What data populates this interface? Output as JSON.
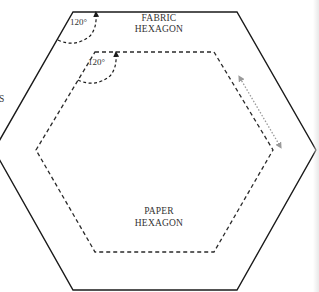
{
  "diagram": {
    "type": "hexagon-template",
    "colors": {
      "outline": "#1a1a1a",
      "dashed": "#2a2a2a",
      "arrow_dotted": "#9a9a9a",
      "text": "#333333",
      "background": "#ffffff"
    },
    "fabric_hexagon": {
      "label_line1": "FABRIC",
      "label_line2": "HEXAGON",
      "style": "solid"
    },
    "paper_hexagon": {
      "label_line1": "PAPER",
      "label_line2": "HEXAGON",
      "style": "dashed"
    },
    "angles": [
      {
        "label": "120°",
        "target": "fabric-hexagon-top-left-corner"
      },
      {
        "label": "120°",
        "target": "paper-hexagon-top-left-corner"
      }
    ],
    "seam_allowance_arrow": {
      "style": "dotted",
      "direction": "double-headed"
    },
    "cut_off_text_left": "S"
  }
}
